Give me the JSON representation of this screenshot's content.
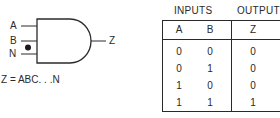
{
  "gate": {
    "type": "AND",
    "inputs": [
      "A",
      "B",
      "N"
    ],
    "ellipsis_marker": "•",
    "output": "Z",
    "equation": "Z = ABC. . .N"
  },
  "truth_table": {
    "group_headers": {
      "inputs": "INPUTS",
      "output": "OUTPUT"
    },
    "columns": [
      "A",
      "B",
      "Z"
    ],
    "rows": [
      {
        "A": "0",
        "B": "0",
        "Z": "0"
      },
      {
        "A": "0",
        "B": "1",
        "Z": "0"
      },
      {
        "A": "1",
        "B": "0",
        "Z": "0"
      },
      {
        "A": "1",
        "B": "1",
        "Z": "1"
      }
    ]
  },
  "colors": {
    "ink": "#2a2a2a",
    "background": "#ffffff"
  }
}
